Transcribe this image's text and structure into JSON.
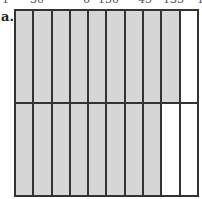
{
  "clipped_top_text": [
    "1",
    "30",
    "6",
    "150",
    "45",
    "135",
    "1"
  ],
  "figure": {
    "label": "a.",
    "columns": 10,
    "rows": [
      {
        "shaded": 9,
        "total": 10
      },
      {
        "shaded": 8,
        "total": 10
      }
    ],
    "colors": {
      "shaded": "#d6d6d6",
      "unshaded": "#ffffff",
      "line": "#333333"
    }
  }
}
